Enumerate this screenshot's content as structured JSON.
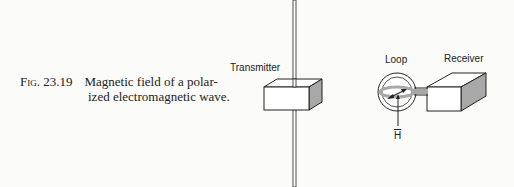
{
  "figure": {
    "number_label": "Fig. 23.19",
    "caption_line1": "Magnetic field of a polar-",
    "caption_line2": "ized electromagnetic wave."
  },
  "diagram": {
    "labels": {
      "transmitter": "Transmitter",
      "loop": "Loop",
      "receiver": "Receiver",
      "field_vector": "H"
    },
    "colors": {
      "line": "#222222",
      "shade": "#a8a8a8",
      "fill": "#ffffff"
    }
  }
}
